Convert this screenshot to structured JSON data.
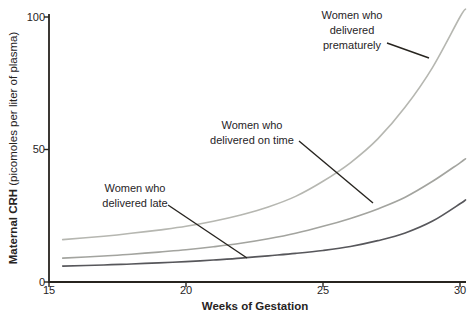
{
  "figure": {
    "background": "#ffffff",
    "axis_color": "#27241f",
    "text_color": "#27241f",
    "xlabel": "Weeks of Gestation",
    "ylabel_bold": "Maternal CRH",
    "ylabel_rest": " (picomoles per liter of plasma)"
  },
  "chart_data": {
    "type": "line",
    "title": "",
    "xlabel": "Weeks of Gestation",
    "ylabel": "Maternal CRH (picomoles per liter of plasma)",
    "xlim": [
      15,
      30.3
    ],
    "ylim": [
      0,
      105
    ],
    "xticks": [
      15,
      20,
      25,
      30
    ],
    "yticks": [
      100,
      50,
      0
    ],
    "grid": false,
    "legend": "curve-annotations",
    "x_weeks": [
      15.5,
      17,
      18,
      19,
      20,
      21,
      22,
      23,
      24,
      25,
      26,
      27,
      28,
      29,
      30,
      30.2
    ],
    "series": [
      {
        "name": "Women who delivered prematurely",
        "color": "#b6b7b1",
        "values": [
          16,
          17.3,
          18.4,
          19.6,
          21,
          22.9,
          25.3,
          28.3,
          32.3,
          38,
          45,
          54,
          66,
          81,
          100,
          103
        ]
      },
      {
        "name": "Women who delivered on time",
        "color": "#a3a49f",
        "values": [
          9,
          9.8,
          10.5,
          11.3,
          12.2,
          13.3,
          14.6,
          16.3,
          18.4,
          21,
          24,
          27.6,
          32,
          38,
          45,
          46.5
        ]
      },
      {
        "name": "Women who delivered late",
        "color": "#57575b",
        "values": [
          6,
          6.4,
          6.8,
          7.2,
          7.7,
          8.3,
          9,
          9.9,
          10.8,
          11.9,
          13.4,
          15.6,
          18.5,
          23,
          29.5,
          31
        ]
      }
    ],
    "annotations": [
      {
        "lines": [
          "Women who",
          "delivered",
          "prematurely"
        ],
        "x": 352,
        "y": 8,
        "pointer": [
          [
            387,
            43
          ],
          [
            429,
            58
          ]
        ]
      },
      {
        "lines": [
          "Women who",
          "delivered on time"
        ],
        "x": 252,
        "y": 118,
        "pointer": [
          [
            299,
            141
          ],
          [
            373,
            203
          ]
        ]
      },
      {
        "lines": [
          "Women who",
          "delivered late"
        ],
        "x": 135,
        "y": 181,
        "pointer": [
          [
            168,
            205
          ],
          [
            247,
            258
          ]
        ]
      }
    ]
  }
}
